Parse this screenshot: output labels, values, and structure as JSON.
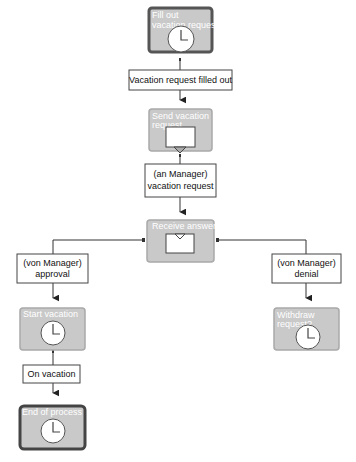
{
  "diagram": {
    "colors": {
      "step_fill": "#c9c9c9",
      "step_border_light": "#a9a9a9",
      "step_border_dark": "#555555",
      "step_text": "#ffffff",
      "connector": "#333333",
      "data_box_border": "#444444",
      "data_box_fill": "#ffffff"
    },
    "steps": {
      "fill_out": {
        "lines": [
          "Fill out",
          "vacation request"
        ],
        "icon": "clock-icon",
        "emphasis": "start"
      },
      "send": {
        "lines": [
          "Send vacation",
          "request"
        ],
        "icon": "send-message-icon"
      },
      "receive": {
        "lines": [
          "Receive answer"
        ],
        "icon": "receive-message-icon"
      },
      "start_vacation": {
        "lines": [
          "Start vacation"
        ],
        "icon": "clock-icon"
      },
      "withdraw": {
        "lines": [
          "Withdraw",
          "request?"
        ],
        "icon": "clock-icon"
      },
      "end": {
        "lines": [
          "End of process"
        ],
        "icon": "clock-icon",
        "emphasis": "end"
      }
    },
    "data_objects": {
      "filled_out": {
        "lines": [
          "Vacation request filled out"
        ]
      },
      "manager_request": {
        "lines": [
          "(an Manager)",
          "vacation request"
        ]
      },
      "approval": {
        "lines": [
          "(von Manager)",
          "approval"
        ]
      },
      "denial": {
        "lines": [
          "(von Manager)",
          "denial"
        ]
      },
      "on_vacation": {
        "lines": [
          "On vacation"
        ]
      }
    }
  }
}
